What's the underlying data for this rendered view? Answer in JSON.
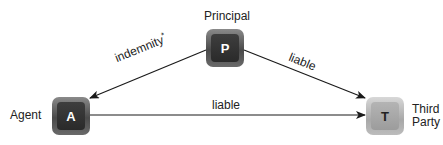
{
  "nodes": {
    "principal": {
      "letter": "P",
      "label": "Principal"
    },
    "agent": {
      "letter": "A",
      "label": "Agent"
    },
    "third_party": {
      "letter": "T",
      "label_line1": "Third",
      "label_line2": "Party"
    }
  },
  "edges": [
    {
      "from": "Principal",
      "to": "Agent",
      "label": "indemnity",
      "marker": "*"
    },
    {
      "from": "Principal",
      "to": "Third Party",
      "label": "liable"
    },
    {
      "from": "Agent",
      "to": "Third Party",
      "label": "liable"
    }
  ],
  "colors": {
    "node_dark": "#3a3a3a",
    "node_light": "#a8a8a8",
    "line": "#1a1a1a"
  }
}
